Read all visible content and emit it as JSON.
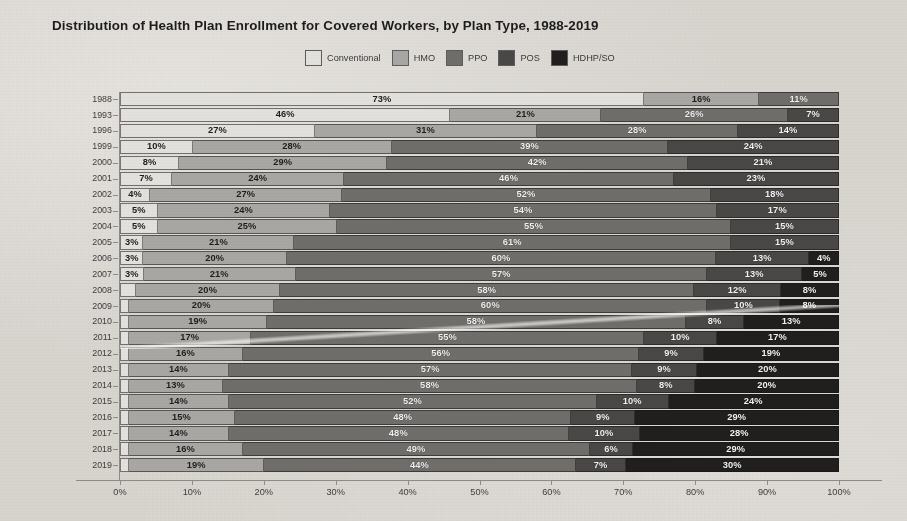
{
  "title": "Distribution of Health Plan Enrollment for Covered Workers, by Plan Type, 1988-2019",
  "legend": [
    {
      "label": "Conventional",
      "color": "#e3e1dd"
    },
    {
      "label": "HMO",
      "color": "#a9a7a3"
    },
    {
      "label": "PPO",
      "color": "#706e6b"
    },
    {
      "label": "POS",
      "color": "#4a4846"
    },
    {
      "label": "HDHP/SO",
      "color": "#201f1e"
    }
  ],
  "axis": {
    "x_ticks": [
      "0%",
      "10%",
      "20%",
      "30%",
      "40%",
      "50%",
      "60%",
      "70%",
      "80%",
      "90%",
      "100%"
    ],
    "x_min": 0,
    "x_max": 100
  },
  "chart_data": {
    "type": "bar",
    "orientation": "horizontal",
    "stacked": "100%",
    "title": "Distribution of Health Plan Enrollment for Covered Workers, by Plan Type, 1988-2019",
    "xlabel": "",
    "ylabel": "",
    "xlim": [
      0,
      100
    ],
    "grid": false,
    "legend_position": "top-center",
    "categories": [
      "1988",
      "1993",
      "1996",
      "1999",
      "2000",
      "2001",
      "2002",
      "2003",
      "2004",
      "2005",
      "2006",
      "2007",
      "2008",
      "2009",
      "2010",
      "2011",
      "2012",
      "2013",
      "2014",
      "2015",
      "2016",
      "2017",
      "2018",
      "2019"
    ],
    "series": [
      {
        "name": "Conventional",
        "color": "#e3e1dd",
        "values": [
          73,
          46,
          27,
          10,
          8,
          7,
          4,
          5,
          5,
          3,
          3,
          3,
          2,
          1,
          1,
          1,
          1,
          1,
          1,
          1,
          1,
          1,
          1,
          1
        ],
        "labels": [
          "73%",
          "46%",
          "27%",
          "10%",
          "8%",
          "7%",
          "4%",
          "5%",
          "5%",
          "3%",
          "3%",
          "3%",
          "",
          "",
          "",
          "",
          "",
          "",
          "",
          "",
          "",
          "",
          "",
          ""
        ]
      },
      {
        "name": "HMO",
        "color": "#a9a7a3",
        "values": [
          16,
          21,
          31,
          28,
          29,
          24,
          27,
          24,
          25,
          21,
          20,
          21,
          20,
          20,
          19,
          17,
          16,
          14,
          13,
          14,
          15,
          14,
          16,
          19
        ],
        "labels": [
          "16%",
          "21%",
          "31%",
          "28%",
          "29%",
          "24%",
          "27%",
          "24%",
          "25%",
          "21%",
          "20%",
          "21%",
          "20%",
          "20%",
          "19%",
          "17%",
          "16%",
          "14%",
          "13%",
          "14%",
          "15%",
          "14%",
          "16%",
          "19%"
        ]
      },
      {
        "name": "PPO",
        "color": "#706e6b",
        "values": [
          11,
          26,
          28,
          39,
          42,
          46,
          52,
          54,
          55,
          61,
          60,
          57,
          58,
          60,
          58,
          55,
          56,
          57,
          58,
          52,
          48,
          48,
          49,
          44
        ],
        "labels": [
          "11%",
          "26%",
          "28%",
          "39%",
          "42%",
          "46%",
          "52%",
          "54%",
          "55%",
          "61%",
          "60%",
          "57%",
          "58%",
          "60%",
          "58%",
          "55%",
          "56%",
          "57%",
          "58%",
          "52%",
          "48%",
          "48%",
          "49%",
          "44%"
        ]
      },
      {
        "name": "POS",
        "color": "#4a4846",
        "values": [
          0,
          7,
          14,
          24,
          21,
          23,
          18,
          17,
          15,
          15,
          13,
          13,
          12,
          10,
          8,
          10,
          9,
          9,
          8,
          10,
          9,
          10,
          6,
          7
        ],
        "labels": [
          "",
          "7%",
          "14%",
          "24%",
          "21%",
          "23%",
          "18%",
          "17%",
          "15%",
          "15%",
          "13%",
          "13%",
          "12%",
          "10%",
          "8%",
          "10%",
          "9%",
          "9%",
          "8%",
          "10%",
          "9%",
          "10%",
          "6%",
          "7%"
        ]
      },
      {
        "name": "HDHP/SO",
        "color": "#201f1e",
        "values": [
          0,
          0,
          0,
          0,
          0,
          0,
          0,
          0,
          0,
          0,
          4,
          5,
          8,
          8,
          13,
          17,
          19,
          20,
          20,
          24,
          29,
          28,
          29,
          30
        ],
        "labels": [
          "",
          "",
          "",
          "",
          "",
          "",
          "",
          "",
          "",
          "",
          "4%",
          "5%",
          "8%",
          "8%",
          "13%",
          "17%",
          "19%",
          "20%",
          "20%",
          "24%",
          "29%",
          "28%",
          "29%",
          "30%"
        ]
      }
    ]
  }
}
